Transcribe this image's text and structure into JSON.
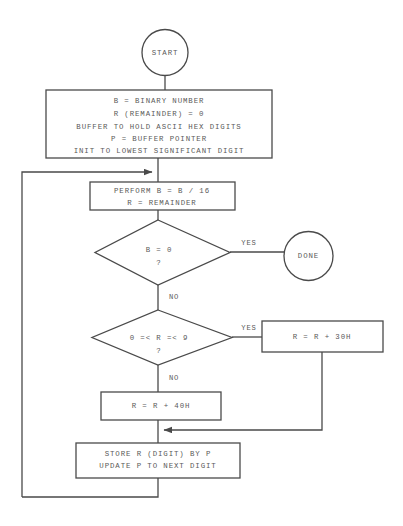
{
  "diagram": {
    "type": "flowchart",
    "background_color": "#ffffff",
    "line_color": "#4a4a4a",
    "text_color": "#5a5a5a"
  },
  "nodes": {
    "start": {
      "kind": "terminator",
      "label": "START"
    },
    "init": {
      "kind": "process",
      "lines": [
        "B = BINARY NUMBER",
        "R (REMAINDER) = 0",
        "BUFFER TO HOLD ASCII HEX DIGITS",
        "P = BUFFER POINTER",
        "INIT TO LOWEST SIGNIFICANT DIGIT"
      ]
    },
    "divide": {
      "kind": "process",
      "lines": [
        "PERFORM B = B / 16",
        "R = REMAINDER"
      ]
    },
    "check_b_zero": {
      "kind": "decision",
      "lines": [
        "B = 0",
        "?"
      ]
    },
    "done": {
      "kind": "terminator",
      "label": "DONE"
    },
    "check_r_range": {
      "kind": "decision",
      "lines": [
        "0 =< R =< 9",
        "?"
      ]
    },
    "add_30h": {
      "kind": "process",
      "lines": [
        "R = R + 30H"
      ]
    },
    "add_40h": {
      "kind": "process",
      "lines": [
        "R = R + 40H"
      ]
    },
    "store": {
      "kind": "process",
      "lines": [
        "STORE R (DIGIT) BY P",
        "UPDATE P TO NEXT DIGIT"
      ]
    }
  },
  "edge_labels": {
    "b_zero_yes": "YES",
    "b_zero_no": "NO",
    "r_range_yes": "YES",
    "r_range_no": "NO"
  }
}
